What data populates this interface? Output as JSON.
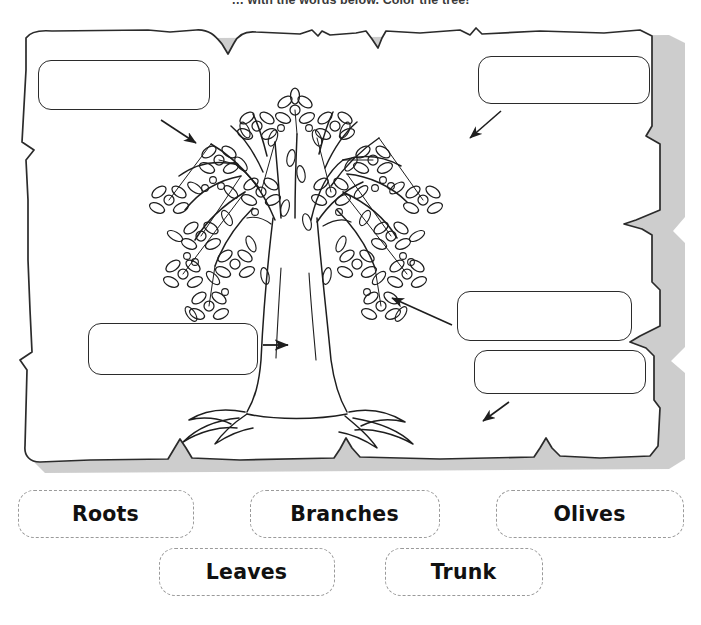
{
  "worksheet": {
    "instruction": "… with the words below. Color the tree!",
    "subject_icon": "olive-tree-illustration"
  },
  "sheet": {
    "style": "torn-paper",
    "paper_color": "#ffffff",
    "outline_color": "#2b2b2b",
    "shadow_color": "#bdbdbd"
  },
  "answer_boxes": [
    {
      "id": "leaves",
      "name": "answer-box-leaves",
      "value": "",
      "placeholder": "",
      "points_to": "canopy-leaves"
    },
    {
      "id": "olives",
      "name": "answer-box-olives",
      "value": "",
      "placeholder": "",
      "points_to": "canopy-olives"
    },
    {
      "id": "branches",
      "name": "answer-box-branches",
      "value": "",
      "placeholder": "",
      "points_to": "branch"
    },
    {
      "id": "roots",
      "name": "answer-box-roots",
      "value": "",
      "placeholder": "",
      "points_to": "roots"
    },
    {
      "id": "trunk",
      "name": "answer-box-trunk",
      "value": "",
      "placeholder": "",
      "points_to": "trunk"
    }
  ],
  "arrows": [
    {
      "id": "arrow-to-leaves",
      "direction": "down-right",
      "from": "answer-box-leaves"
    },
    {
      "id": "arrow-to-olives",
      "direction": "down-left",
      "from": "answer-box-olives"
    },
    {
      "id": "arrow-to-branches",
      "direction": "left",
      "from": "answer-box-branches"
    },
    {
      "id": "arrow-to-roots",
      "direction": "down-left",
      "from": "answer-box-roots"
    },
    {
      "id": "arrow-to-trunk",
      "direction": "right",
      "from": "answer-box-trunk"
    }
  ],
  "word_bank": {
    "border_style": "dashed",
    "border_color": "#9a9a9a",
    "text_color": "#111111",
    "rows": [
      [
        {
          "label": "Roots",
          "name": "word-chip-roots"
        },
        {
          "label": "Branches",
          "name": "word-chip-branches"
        },
        {
          "label": "Olives",
          "name": "word-chip-olives"
        }
      ],
      [
        {
          "label": "Leaves",
          "name": "word-chip-leaves"
        },
        {
          "label": "Trunk",
          "name": "word-chip-trunk"
        }
      ]
    ]
  }
}
